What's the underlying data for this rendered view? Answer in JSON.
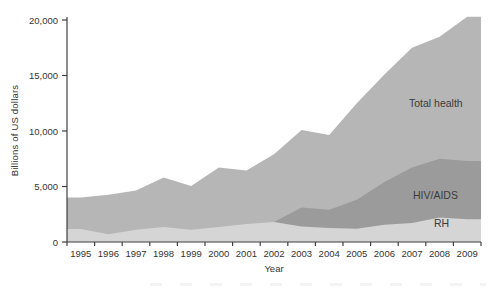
{
  "figure": {
    "ylabel": "Billions of US dollars",
    "xlabel": "Year",
    "area_labels": {
      "total_health": "Total health",
      "hiv_aids": "HIV/AIDS",
      "rh": "RH"
    }
  },
  "chart_data": {
    "type": "area",
    "title": "",
    "xlabel": "Year",
    "ylabel": "Billions of US dollars",
    "categories": [
      "1995",
      "1996",
      "1997",
      "1998",
      "1999",
      "2000",
      "2001",
      "2002",
      "2003",
      "2004",
      "2005",
      "2006",
      "2007",
      "2008",
      "2009"
    ],
    "series": [
      {
        "name": "Total health",
        "color": "#b6b6b6",
        "values": [
          4000,
          4250,
          4650,
          5800,
          5050,
          6700,
          6450,
          7900,
          10100,
          9650,
          12500,
          15100,
          17500,
          18500,
          20300
        ]
      },
      {
        "name": "HIV/AIDS",
        "color": "#9b9b9b",
        "values": [
          300,
          400,
          500,
          600,
          700,
          900,
          1200,
          1800,
          3100,
          2900,
          3800,
          5400,
          6700,
          7500,
          7300
        ]
      },
      {
        "name": "RH",
        "color": "#d5d5d5",
        "values": [
          1170,
          700,
          1110,
          1350,
          1110,
          1350,
          1620,
          1800,
          1400,
          1260,
          1200,
          1560,
          1710,
          2200,
          2050
        ]
      }
    ],
    "ylim": [
      0,
      20000
    ],
    "y_tick_values": [
      0,
      5000,
      10000,
      15000,
      20000
    ],
    "y_tick_labels": [
      "0",
      "5,000",
      "10,000",
      "15,000",
      "20,000"
    ],
    "grid": false,
    "legend": "inline-labels",
    "axis_color": "#3f3f3f"
  }
}
